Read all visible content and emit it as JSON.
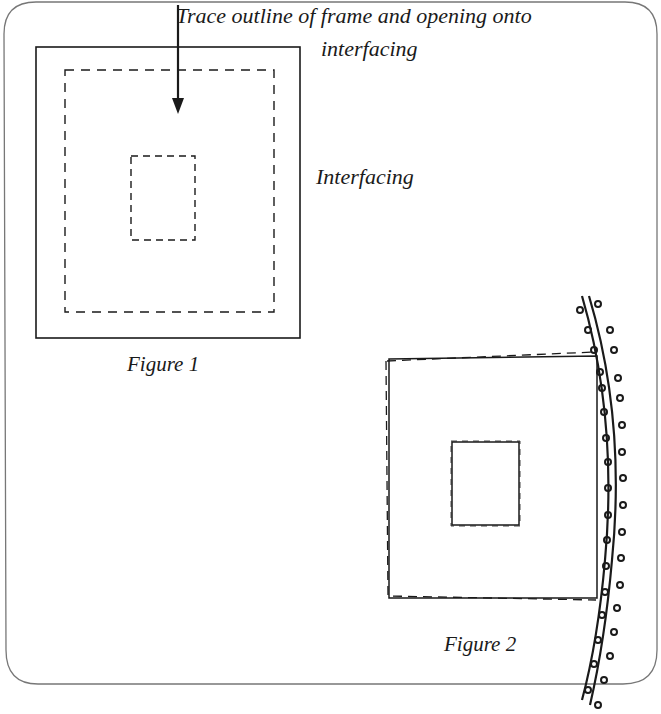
{
  "figure1": {
    "caption": "Figure 1",
    "annotation_line1": "Trace outline of frame and opening onto",
    "annotation_line2": "interfacing",
    "side_label": "Interfacing"
  },
  "figure2": {
    "caption": "Figure 2"
  },
  "colors": {
    "ink": "#1a1a1a",
    "frame": "#6b6b6b",
    "background": "#ffffff"
  },
  "icons": {
    "arrow": "down-arrow-icon",
    "trim": "beaded-trim-icon"
  }
}
